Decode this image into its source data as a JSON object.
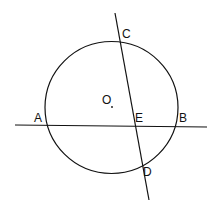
{
  "diagram": {
    "circle": {
      "center_label": "O",
      "cx": 111.5,
      "cy": 107.5,
      "r": 66
    },
    "lines": [
      {
        "name": "AB",
        "x1": 15,
        "y1": 125,
        "x2": 207,
        "y2": 127
      },
      {
        "name": "CD",
        "x1": 115,
        "y1": 13,
        "x2": 149,
        "y2": 200
      }
    ],
    "labels": {
      "A": "A",
      "B": "B",
      "C": "C",
      "D": "D",
      "E": "E",
      "O": "O"
    }
  }
}
